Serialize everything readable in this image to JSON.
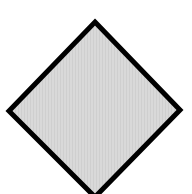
{
  "diagram": {
    "shape": "diamond",
    "vertices": {
      "top": [
        95,
        22
      ],
      "right": [
        180,
        110
      ],
      "bottom": [
        95,
        197
      ],
      "left": [
        9,
        111
      ]
    },
    "fill_color": "#d9d9d9",
    "stripe_color": "#cfcfcf",
    "stroke_color": "#000000",
    "stroke_width": 5,
    "background_color": "#ffffff"
  }
}
